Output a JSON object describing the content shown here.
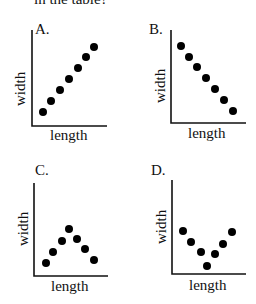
{
  "header": {
    "text": "in the table?"
  },
  "panels": [
    {
      "label": "A.",
      "xlabel": "length",
      "ylabel": "width",
      "pattern": "increasing",
      "points": [
        [
          1,
          1
        ],
        [
          2,
          2
        ],
        [
          3,
          3
        ],
        [
          4,
          4
        ],
        [
          5,
          5
        ],
        [
          6,
          6
        ],
        [
          7,
          7
        ]
      ]
    },
    {
      "label": "B.",
      "xlabel": "length",
      "ylabel": "width",
      "pattern": "decreasing",
      "points": [
        [
          1,
          7
        ],
        [
          2,
          6
        ],
        [
          3,
          5
        ],
        [
          4,
          4
        ],
        [
          5,
          3
        ],
        [
          6,
          2
        ],
        [
          7,
          1
        ]
      ]
    },
    {
      "label": "C.",
      "xlabel": "length",
      "ylabel": "width",
      "pattern": "increase-then-decrease",
      "points": [
        [
          1,
          1
        ],
        [
          2,
          2
        ],
        [
          3,
          3
        ],
        [
          4,
          4
        ],
        [
          5,
          3
        ],
        [
          6,
          2
        ],
        [
          7,
          1
        ]
      ]
    },
    {
      "label": "D.",
      "xlabel": "length",
      "ylabel": "width",
      "pattern": "decrease-then-increase",
      "points": [
        [
          1,
          4
        ],
        [
          2,
          3
        ],
        [
          3,
          2
        ],
        [
          4,
          1
        ],
        [
          5,
          2
        ],
        [
          6,
          3
        ],
        [
          7,
          4
        ]
      ]
    }
  ],
  "colors": {
    "dot": "#000000",
    "axis": "#111111",
    "background": "#ffffff"
  }
}
